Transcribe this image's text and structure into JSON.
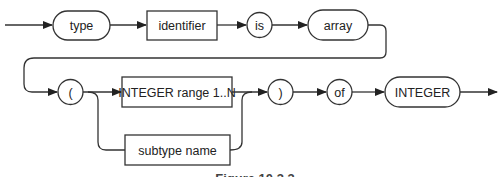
{
  "diagram": {
    "type": "syntax-diagram",
    "row1": {
      "nodes": [
        {
          "id": "type",
          "label": "type",
          "kind": "keyword-pill"
        },
        {
          "id": "identifier",
          "label": "identifier",
          "kind": "nonterminal-box"
        },
        {
          "id": "is",
          "label": "is",
          "kind": "keyword-circle"
        },
        {
          "id": "array",
          "label": "array",
          "kind": "keyword-pill"
        }
      ]
    },
    "row2": {
      "nodes": [
        {
          "id": "lparen",
          "label": "(",
          "kind": "symbol-circle"
        },
        {
          "id": "range",
          "label": "INTEGER range 1..N",
          "kind": "nonterminal-box"
        },
        {
          "id": "subtype",
          "label": "subtype name",
          "kind": "nonterminal-box"
        },
        {
          "id": "rparen",
          "label": ")",
          "kind": "symbol-circle"
        },
        {
          "id": "of",
          "label": "of",
          "kind": "keyword-circle"
        },
        {
          "id": "integer",
          "label": "INTEGER",
          "kind": "keyword-pill"
        }
      ],
      "alternatives": [
        "INTEGER range 1..N",
        "subtype name"
      ]
    },
    "caption": "Figure 10.3.3",
    "colors": {
      "stroke": "#333333",
      "text": "#222222",
      "background": "#ffffff"
    }
  }
}
